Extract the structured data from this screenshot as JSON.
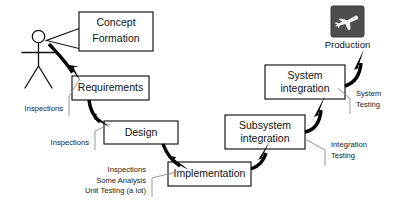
{
  "diagram": {
    "canvas": {
      "width": 398,
      "height": 212
    },
    "colors": {
      "box_fill": "#ffffff",
      "box_stroke": "#1a1a1a",
      "arrow": "#000000",
      "leader": "#8c8c8c",
      "text": "#111111",
      "production_icon_bg": "#4d4d4d",
      "production_icon_glyph": "#f2f2f2"
    },
    "actor": {
      "name": "stick-figure-person"
    },
    "stages": [
      {
        "id": "concept",
        "label_line1": "Concept",
        "label_line2": "Formation"
      },
      {
        "id": "requirements",
        "label_line1": "Requirements",
        "label_line2": ""
      },
      {
        "id": "design",
        "label_line1": "Design",
        "label_line2": ""
      },
      {
        "id": "implementation",
        "label_line1": "Implementation",
        "label_line2": ""
      },
      {
        "id": "subsystem",
        "label_line1": "Subsystem",
        "label_line2": "integration"
      },
      {
        "id": "system",
        "label_line1": "System",
        "label_line2": "integration"
      }
    ],
    "production": {
      "label": "Production",
      "icon": "airplane-icon"
    },
    "annotations": [
      {
        "id": "annot-requirements",
        "align": "right",
        "lines": [
          "Inspections"
        ]
      },
      {
        "id": "annot-design",
        "align": "right",
        "lines": [
          "Inspections"
        ]
      },
      {
        "id": "annot-implementation",
        "align": "right",
        "lines": [
          "Inspections",
          "Some Analysis",
          "Unit Testing (a lot)"
        ]
      },
      {
        "id": "annot-integration",
        "align": "left",
        "lines": [
          "Integration",
          "Testing"
        ]
      },
      {
        "id": "annot-system",
        "align": "left",
        "lines": [
          "System",
          "Testing"
        ]
      }
    ]
  }
}
